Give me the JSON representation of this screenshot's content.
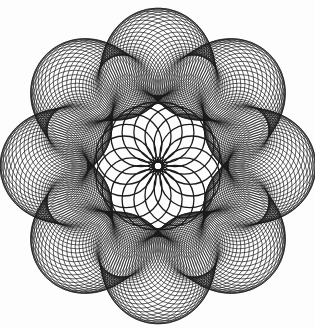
{
  "image": {
    "subject": "spirograph rosette drawing",
    "background_color": "#fdfdfd",
    "ink_color": "#1a1a1a",
    "width": 315,
    "height": 329
  },
  "figure": {
    "center": [
      158,
      166
    ],
    "outer_band": {
      "lobes": 8,
      "loops_per_lobe": 34,
      "path_radius": 100,
      "path_wobble": 14,
      "loop_radius": 38,
      "loop_radius_wobble": 6,
      "stroke_width": 0.7
    },
    "inner_rosette": {
      "circles": 18,
      "ring_radius": 34,
      "circle_radius": 30,
      "stroke_width": 1.3
    }
  }
}
